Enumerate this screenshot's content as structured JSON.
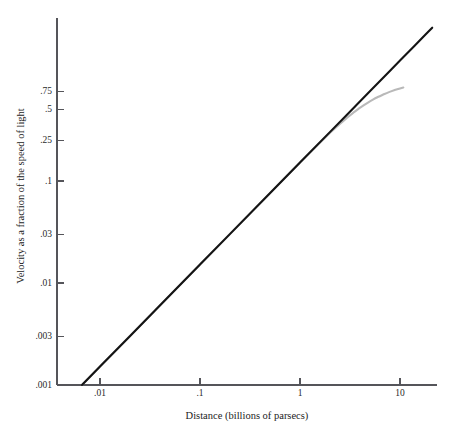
{
  "chart_data": {
    "type": "line",
    "title": "",
    "subtitle": "",
    "xlabel": "Distance (billions of parsecs)",
    "ylabel": "Velocity as a fraction of the speed of light",
    "xscale": "log",
    "yscale": "log",
    "xlim": [
      0.004,
      22
    ],
    "ylim": [
      0.001,
      0.85
    ],
    "grid": false,
    "legend": null,
    "legend_position": "none",
    "xticks": [
      {
        "value": 0.01,
        "label": ".01"
      },
      {
        "value": 0.1,
        "label": ".1"
      },
      {
        "value": 1,
        "label": "1"
      },
      {
        "value": 10,
        "label": "10"
      }
    ],
    "yticks": [
      {
        "value": 0.001,
        "label": ".001"
      },
      {
        "value": 0.003,
        "label": ".003"
      },
      {
        "value": 0.01,
        "label": ".01"
      },
      {
        "value": 0.03,
        "label": ".03"
      },
      {
        "value": 0.1,
        "label": ".1"
      },
      {
        "value": 0.25,
        "label": ".25"
      },
      {
        "value": 0.5,
        "label": ".5"
      },
      {
        "value": 0.75,
        "label": ".75"
      }
    ],
    "series": [
      {
        "name": "linear-hubble-law",
        "color": "#141414",
        "width": 2.1,
        "x": [
          0.0066,
          0.01,
          0.02,
          0.05,
          0.1,
          0.2,
          0.5,
          1,
          2,
          3,
          5,
          8,
          10,
          14,
          18,
          21
        ],
        "y": [
          0.001,
          0.00152,
          0.00303,
          0.00758,
          0.01515,
          0.0303,
          0.0758,
          0.1515,
          0.303,
          0.4545,
          0.7576,
          1.2121,
          1.5152,
          2.1212,
          2.7273,
          3.1818
        ]
      },
      {
        "name": "relativistic-recession",
        "color": "#b9b9b9",
        "width": 2.1,
        "x": [
          0.0066,
          0.01,
          0.05,
          0.1,
          0.5,
          1,
          1.5,
          2,
          2.5,
          3,
          3.5,
          4,
          5,
          6,
          7,
          8,
          9,
          10,
          10.8
        ],
        "y": [
          0.001,
          0.00152,
          0.00758,
          0.01515,
          0.0758,
          0.1515,
          0.2255,
          0.2965,
          0.3625,
          0.4225,
          0.4765,
          0.525,
          0.6045,
          0.6655,
          0.7135,
          0.752,
          0.783,
          0.809,
          0.826
        ]
      }
    ],
    "annotations": []
  },
  "geometry": {
    "plot_left": 57,
    "plot_right": 437,
    "plot_top": 18,
    "plot_bottom": 385,
    "x_origin_px": 100,
    "x_decade_px": 100,
    "y_origin_px": 385,
    "y_decade_px": 102,
    "y_top_clip": 0.8,
    "xlabel_x": 247,
    "xlabel_y": 419,
    "ylabel_x": 24,
    "ylabel_y": 196
  }
}
